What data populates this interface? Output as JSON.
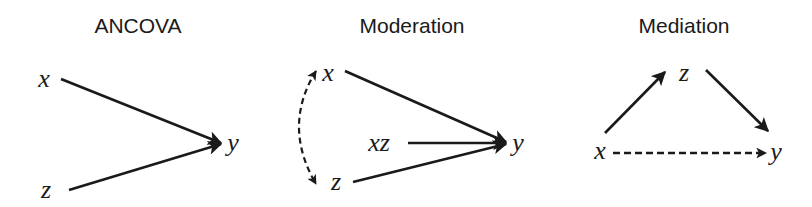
{
  "panels": [
    {
      "id": "ancova",
      "title": "ANCOVA",
      "nodes": {
        "x": "x",
        "z": "z",
        "y": "y"
      },
      "edges": [
        {
          "from": "x",
          "to": "y",
          "style": "solid"
        },
        {
          "from": "z",
          "to": "y",
          "style": "solid"
        }
      ]
    },
    {
      "id": "moderation",
      "title": "Moderation",
      "nodes": {
        "x": "x",
        "xz": "xz",
        "z": "z",
        "y": "y"
      },
      "edges": [
        {
          "from": "x",
          "to": "y",
          "style": "solid"
        },
        {
          "from": "xz",
          "to": "y",
          "style": "solid"
        },
        {
          "from": "z",
          "to": "y",
          "style": "solid"
        },
        {
          "from": "x",
          "to": "z",
          "style": "dashed",
          "bidirectional": true,
          "curved": true
        }
      ]
    },
    {
      "id": "mediation",
      "title": "Mediation",
      "nodes": {
        "x": "x",
        "z": "z",
        "y": "y"
      },
      "edges": [
        {
          "from": "x",
          "to": "z",
          "style": "solid"
        },
        {
          "from": "z",
          "to": "y",
          "style": "solid"
        },
        {
          "from": "x",
          "to": "y",
          "style": "dashed"
        }
      ]
    }
  ],
  "colors": {
    "ink": "#1a1a1a",
    "background": "#ffffff"
  }
}
